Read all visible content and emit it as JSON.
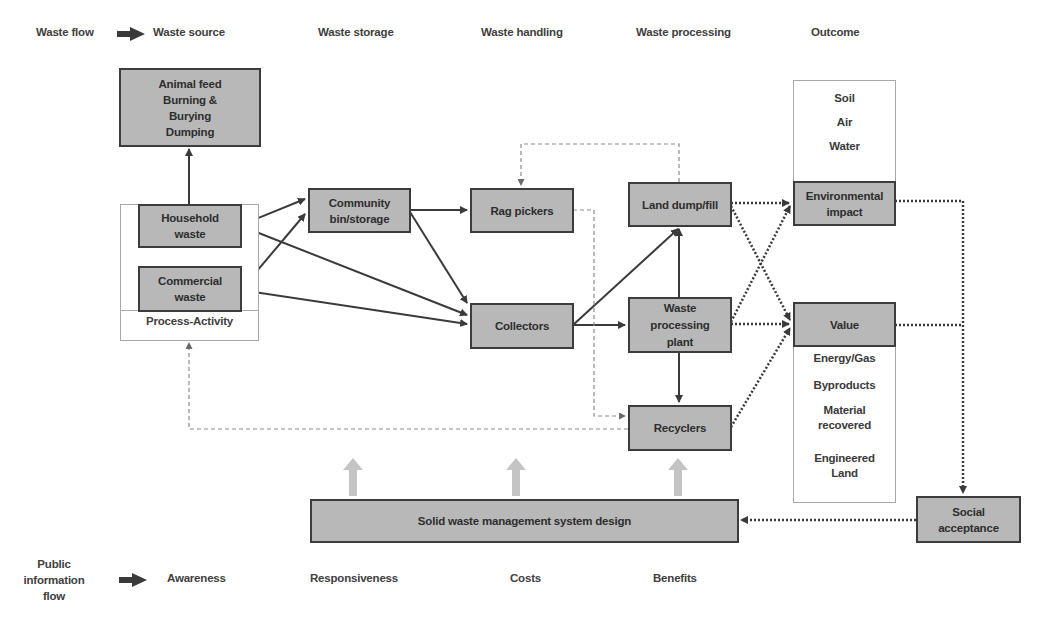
{
  "legend": {
    "waste_flow": "Waste flow",
    "public_info_flow": [
      "Public",
      "information",
      "flow"
    ]
  },
  "column_headers": {
    "top": [
      "Waste source",
      "Waste storage",
      "Waste handling",
      "Waste processing",
      "Outcome"
    ],
    "bottom": [
      "Awareness",
      "Responsiveness",
      "Costs",
      "Benefits"
    ]
  },
  "nodes": {
    "disposal": [
      "Animal feed",
      "Burning &",
      "Burying",
      "Dumping"
    ],
    "household": [
      "Household",
      "waste"
    ],
    "commercial": [
      "Commercial",
      "waste"
    ],
    "process_activity": "Process-Activity",
    "community_bin": [
      "Community",
      "bin/storage"
    ],
    "rag_pickers": "Rag pickers",
    "collectors": "Collectors",
    "land_dump": "Land dump/fill",
    "processing_plant": [
      "Waste",
      "processing",
      "plant"
    ],
    "recyclers": "Recyclers",
    "environmental_impact": [
      "Environmental",
      "impact"
    ],
    "value": "Value",
    "social_acceptance": [
      "Social",
      "acceptance"
    ],
    "swm_design": "Solid waste management system design"
  },
  "outcome_env_items": [
    "Soil",
    "Air",
    "Water"
  ],
  "outcome_value_items": [
    "Energy/Gas",
    "Byproducts",
    "Material recovered",
    "Engineered Land"
  ],
  "colors": {
    "node_fill": "#b8b8b8",
    "node_border": "#3c3c3c",
    "arrow": "#3a3a3a",
    "dashed": "#8c8c8c",
    "info_arrow": "#c4c4c4"
  }
}
